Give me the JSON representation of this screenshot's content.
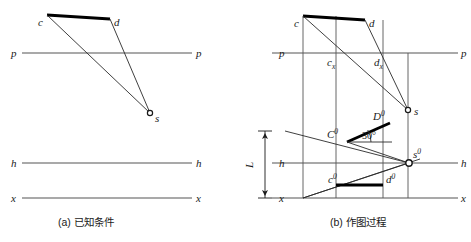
{
  "figure": {
    "title": "",
    "panels": [
      {
        "id": "a",
        "caption": "(a) 已知条件",
        "labels": {
          "c": "c",
          "d": "d",
          "s": "s",
          "p_left": "p",
          "p_right": "p",
          "h_left": "h",
          "h_right": "h",
          "x_left": "x",
          "x_right": "x"
        }
      },
      {
        "id": "b",
        "caption": "(b) 作图过程",
        "labels": {
          "c": "c",
          "d": "d",
          "cx": "c",
          "cx_sub": "x",
          "dx": "d",
          "dx_sub": "x",
          "s": "s",
          "C0": "C",
          "C0_sup": "0",
          "D0": "D",
          "D0_sup": "0",
          "c0": "c",
          "c0_sup": "0",
          "d0": "d",
          "d0_sup": "0",
          "s0": "s",
          "s0_sup": "0",
          "angle": "30°",
          "L": "L",
          "p_left": "p",
          "p_right": "p",
          "h_left": "h",
          "h_right": "h",
          "x_left": "x",
          "x_right": "x"
        }
      }
    ],
    "colors": {
      "ink": "#1a1a1a",
      "thin_line": "#4a4a4a",
      "reference_line": "#555555",
      "thick_line": "#000000",
      "background": "#ffffff"
    },
    "geometry": {
      "panel_a": {
        "p_line_y": 53,
        "h_line_y": 163,
        "x_line_y": 198,
        "line_x_start": 22,
        "line_x_end": 192,
        "c": [
          47,
          15
        ],
        "d": [
          110,
          19
        ],
        "s": [
          150,
          113
        ]
      },
      "panel_b": {
        "p_line_y": 53,
        "h_line_y": 163,
        "x_line_y": 198,
        "line_x_start": 272,
        "line_x_end": 458,
        "c": [
          303,
          16
        ],
        "d": [
          365,
          20
        ],
        "cx": [
          336,
          53
        ],
        "dx": [
          383,
          53
        ],
        "s": [
          408,
          110
        ],
        "C0": [
          347,
          142
        ],
        "D0": [
          390,
          123
        ],
        "c0": [
          336,
          185
        ],
        "d0": [
          383,
          185
        ],
        "s0": [
          409,
          163
        ],
        "L_x": 265,
        "L_top": 131,
        "L_bottom": 198,
        "angle_deg": 30
      }
    }
  }
}
